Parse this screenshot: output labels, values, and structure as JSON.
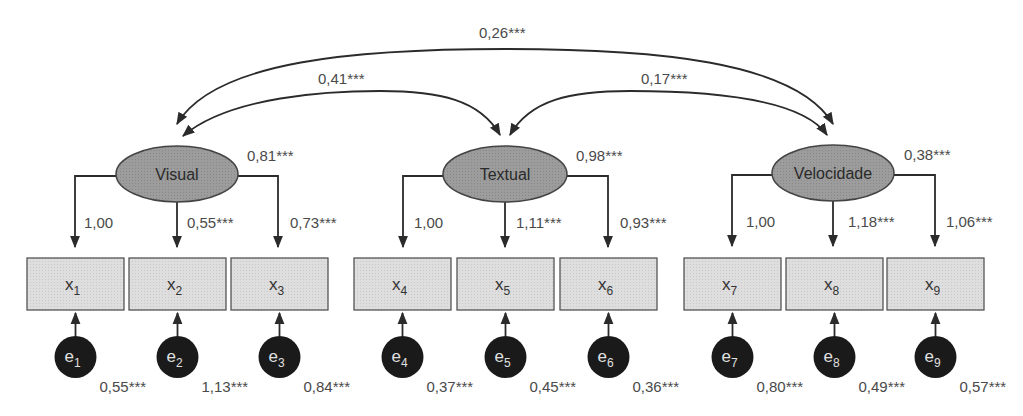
{
  "diagram": {
    "type": "structural-equation-model",
    "colors": {
      "factor_fill": "#9a9a9a",
      "indicator_fill": "#dcdcdc",
      "error_fill": "#1a1a1a",
      "line": "#2b2b2b"
    },
    "factors": [
      {
        "id": "visual",
        "label": "Visual",
        "variance": "0,81***"
      },
      {
        "id": "textual",
        "label": "Textual",
        "variance": "0,98***"
      },
      {
        "id": "velocidade",
        "label": "Velocidade",
        "variance": "0,38***"
      }
    ],
    "indicators": [
      {
        "id": "x1",
        "base": "x",
        "sub": "1",
        "factor": "visual",
        "loading": "1,00",
        "error": {
          "base": "e",
          "sub": "1",
          "variance": "0,55***"
        }
      },
      {
        "id": "x2",
        "base": "x",
        "sub": "2",
        "factor": "visual",
        "loading": "0,55***",
        "error": {
          "base": "e",
          "sub": "2",
          "variance": "1,13***"
        }
      },
      {
        "id": "x3",
        "base": "x",
        "sub": "3",
        "factor": "visual",
        "loading": "0,73***",
        "error": {
          "base": "e",
          "sub": "3",
          "variance": "0,84***"
        }
      },
      {
        "id": "x4",
        "base": "x",
        "sub": "4",
        "factor": "textual",
        "loading": "1,00",
        "error": {
          "base": "e",
          "sub": "4",
          "variance": "0,37***"
        }
      },
      {
        "id": "x5",
        "base": "x",
        "sub": "5",
        "factor": "textual",
        "loading": "1,11***",
        "error": {
          "base": "e",
          "sub": "5",
          "variance": "0,45***"
        }
      },
      {
        "id": "x6",
        "base": "x",
        "sub": "6",
        "factor": "textual",
        "loading": "0,93***",
        "error": {
          "base": "e",
          "sub": "6",
          "variance": "0,36***"
        }
      },
      {
        "id": "x7",
        "base": "x",
        "sub": "7",
        "factor": "velocidade",
        "loading": "1,00",
        "error": {
          "base": "e",
          "sub": "7",
          "variance": "0,80***"
        }
      },
      {
        "id": "x8",
        "base": "x",
        "sub": "8",
        "factor": "velocidade",
        "loading": "1,18***",
        "error": {
          "base": "e",
          "sub": "8",
          "variance": "0,49***"
        }
      },
      {
        "id": "x9",
        "base": "x",
        "sub": "9",
        "factor": "velocidade",
        "loading": "1,06***",
        "error": {
          "base": "e",
          "sub": "9",
          "variance": "0,57***"
        }
      }
    ],
    "covariances": [
      {
        "from": "visual",
        "to": "textual",
        "value": "0,41***"
      },
      {
        "from": "textual",
        "to": "velocidade",
        "value": "0,17***"
      },
      {
        "from": "visual",
        "to": "velocidade",
        "value": "0,26***"
      }
    ]
  }
}
